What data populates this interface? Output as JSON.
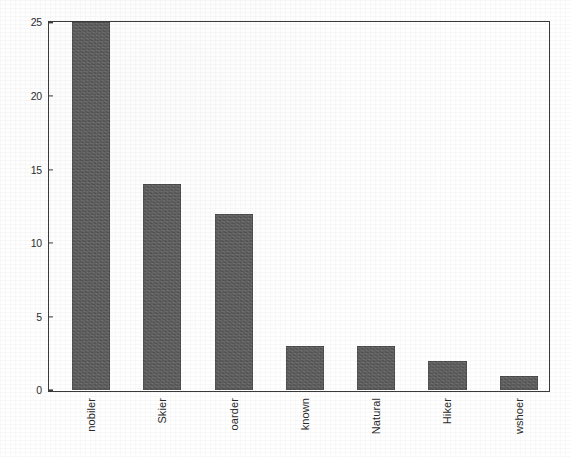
{
  "chart_data": {
    "type": "bar",
    "title": "",
    "subtitle": "",
    "xlabel": "",
    "ylabel": "",
    "categories": [
      "nobiler",
      "Skier",
      "oarder",
      "known",
      "Natural",
      "Hiker",
      "wshoer"
    ],
    "values": [
      25,
      14,
      12,
      3,
      3,
      2,
      1
    ],
    "ylim": [
      0,
      25
    ],
    "yticks": [
      0,
      5,
      10,
      15,
      20,
      25
    ],
    "ytick_labels": [
      "0",
      "5",
      "10",
      "15",
      "20",
      "25"
    ],
    "grid": false,
    "legend": null,
    "bar_color": "#5a5a5a",
    "axis_color": "#3a3a3a",
    "background_color": "#ffffff"
  },
  "axis": {
    "y_ticks": [
      {
        "label": "25",
        "value": 25
      },
      {
        "label": "20",
        "value": 20
      },
      {
        "label": "15",
        "value": 15
      },
      {
        "label": "10",
        "value": 10
      },
      {
        "label": "5",
        "value": 5
      },
      {
        "label": "0",
        "value": 0
      }
    ]
  },
  "bars": [
    {
      "label": "nobiler",
      "value": 25,
      "clipped": true
    },
    {
      "label": "Skier",
      "value": 14,
      "clipped": false
    },
    {
      "label": "oarder",
      "value": 12,
      "clipped": false
    },
    {
      "label": "known",
      "value": 3,
      "clipped": false
    },
    {
      "label": "Natural",
      "value": 3,
      "clipped": false
    },
    {
      "label": "Hiker",
      "value": 2,
      "clipped": false
    },
    {
      "label": "wshoer",
      "value": 1,
      "clipped": false
    }
  ]
}
